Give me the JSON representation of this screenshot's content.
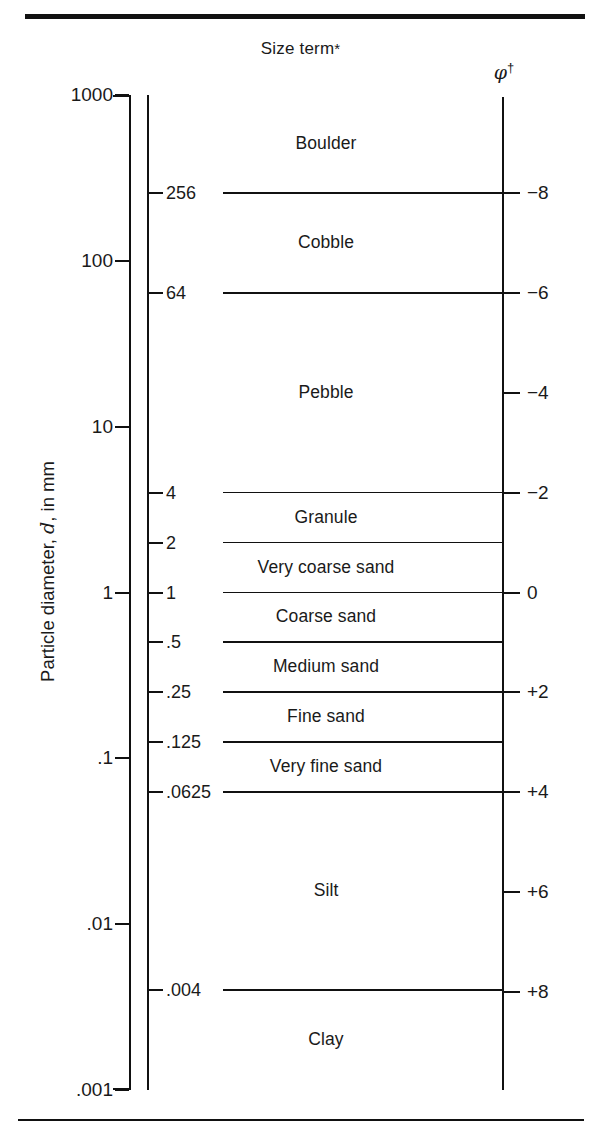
{
  "figure": {
    "headers": {
      "size_term": "Size term",
      "size_term_marker": "*",
      "phi_symbol": "φ",
      "phi_marker": "†"
    },
    "y_axis_title_prefix": "Particle diameter, ",
    "y_axis_title_italic": "d",
    "y_axis_title_suffix": ", in mm"
  },
  "chart_data": {
    "type": "table",
    "title": "Size term",
    "ylabel": "Particle diameter, d, in mm",
    "scale": "log10",
    "ylim": [
      0.001,
      1000
    ],
    "grid": false,
    "legend": "none",
    "secondary_axis": {
      "label": "φ†",
      "relation": "phi = -log2(d in mm)",
      "ticks": [
        {
          "label": "−8",
          "phi": -8,
          "mm": 256,
          "has_boundary_line": true
        },
        {
          "label": "−6",
          "phi": -6,
          "mm": 64,
          "has_boundary_line": true
        },
        {
          "label": "−4",
          "phi": -4,
          "mm": 16,
          "has_boundary_line": false
        },
        {
          "label": "−2",
          "phi": -2,
          "mm": 4,
          "has_boundary_line": true
        },
        {
          "label": "0",
          "phi": 0,
          "mm": 1,
          "has_boundary_line": true
        },
        {
          "label": "+2",
          "phi": 2,
          "mm": 0.25,
          "has_boundary_line": true
        },
        {
          "label": "+4",
          "phi": 4,
          "mm": 0.0625,
          "has_boundary_line": true
        },
        {
          "label": "+6",
          "phi": 6,
          "mm": 0.015625,
          "has_boundary_line": false
        },
        {
          "label": "+8",
          "phi": 8,
          "mm": 0.00390625,
          "has_boundary_line": true
        }
      ]
    },
    "mm_axis_ticks": [
      {
        "label": "1000",
        "value": 1000
      },
      {
        "label": "100",
        "value": 100
      },
      {
        "label": "10",
        "value": 10
      },
      {
        "label": "1",
        "value": 1
      },
      {
        "label": ".1",
        "value": 0.1
      },
      {
        "label": ".01",
        "value": 0.01
      },
      {
        "label": ".001",
        "value": 0.001
      }
    ],
    "boundaries": [
      {
        "label": "256",
        "value": 256
      },
      {
        "label": "64",
        "value": 64
      },
      {
        "label": "4",
        "value": 4
      },
      {
        "label": "2",
        "value": 2
      },
      {
        "label": "1",
        "value": 1
      },
      {
        "label": ".5",
        "value": 0.5
      },
      {
        "label": ".25",
        "value": 0.25
      },
      {
        "label": ".125",
        "value": 0.125
      },
      {
        "label": ".0625",
        "value": 0.0625
      },
      {
        "label": ".004",
        "value": 0.004
      }
    ],
    "categories": [
      {
        "name": "Boulder",
        "upper_mm": 1000,
        "lower_mm": 256
      },
      {
        "name": "Cobble",
        "upper_mm": 256,
        "lower_mm": 64
      },
      {
        "name": "Pebble",
        "upper_mm": 64,
        "lower_mm": 4
      },
      {
        "name": "Granule",
        "upper_mm": 4,
        "lower_mm": 2
      },
      {
        "name": "Very coarse sand",
        "upper_mm": 2,
        "lower_mm": 1
      },
      {
        "name": "Coarse sand",
        "upper_mm": 1,
        "lower_mm": 0.5
      },
      {
        "name": "Medium sand",
        "upper_mm": 0.5,
        "lower_mm": 0.25
      },
      {
        "name": "Fine sand",
        "upper_mm": 0.25,
        "lower_mm": 0.125
      },
      {
        "name": "Very fine sand",
        "upper_mm": 0.125,
        "lower_mm": 0.0625
      },
      {
        "name": "Silt",
        "upper_mm": 0.0625,
        "lower_mm": 0.004
      },
      {
        "name": "Clay",
        "upper_mm": 0.004,
        "lower_mm": 0.001
      }
    ]
  }
}
